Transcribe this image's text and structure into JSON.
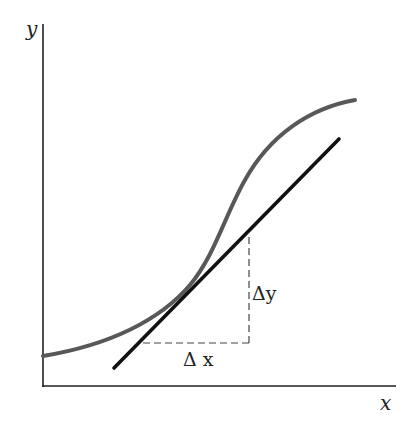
{
  "diagram": {
    "axes": {
      "y_label": "y",
      "x_label": "x",
      "color": "#222222"
    },
    "curve": {
      "description": "sigmoid-like curve",
      "color": "#555555"
    },
    "tangent": {
      "description": "tangent line at point of contact",
      "color": "#111111"
    },
    "slope_triangle": {
      "delta_x_label": "Δ x",
      "delta_y_label": "Δy",
      "dash_color": "#444444"
    }
  }
}
